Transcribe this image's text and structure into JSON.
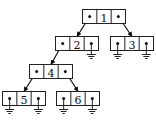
{
  "diagram": {
    "title": "",
    "type": "binary-tree-linked-representation",
    "colors": {
      "stroke": "#222222",
      "fill": "#ffffff",
      "text": "#111111"
    },
    "nodes": [
      {
        "id": "1",
        "label": "1",
        "x": 82,
        "y": 9,
        "left": "2",
        "right": "3"
      },
      {
        "id": "2",
        "label": "2",
        "x": 55,
        "y": 36,
        "left": "4",
        "right": null
      },
      {
        "id": "3",
        "label": "3",
        "x": 110,
        "y": 36,
        "left": null,
        "right": null
      },
      {
        "id": "4",
        "label": "4",
        "x": 29,
        "y": 64,
        "left": "5",
        "right": "6"
      },
      {
        "id": "5",
        "label": "5",
        "x": 2,
        "y": 91,
        "left": null,
        "right": null
      },
      {
        "id": "6",
        "label": "6",
        "x": 56,
        "y": 91,
        "left": null,
        "right": null
      }
    ],
    "node_size": {
      "width": 43,
      "height": 14,
      "cell_width": 14.33
    },
    "null_symbol": "ground-icon"
  }
}
